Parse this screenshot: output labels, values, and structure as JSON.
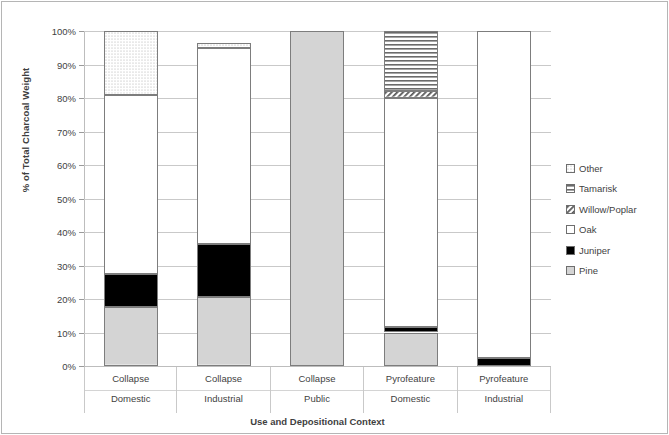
{
  "chart_data": {
    "type": "bar",
    "subtype": "stacked-100-percent",
    "title": "",
    "xlabel": "Use and Depositional Context",
    "ylabel": "% of Total Charcoal Weight",
    "ylim": [
      0,
      100
    ],
    "ytick_labels": [
      "0%",
      "10%",
      "20%",
      "30%",
      "40%",
      "50%",
      "60%",
      "70%",
      "80%",
      "90%",
      "100%"
    ],
    "ytick_values": [
      0,
      10,
      20,
      30,
      40,
      50,
      60,
      70,
      80,
      90,
      100
    ],
    "grid": true,
    "legend_position": "right",
    "categories": [
      {
        "line1": "Collapse",
        "line2": "Domestic"
      },
      {
        "line1": "Collapse",
        "line2": "Industrial"
      },
      {
        "line1": "Collapse",
        "line2": "Public"
      },
      {
        "line1": "Pyrofeature",
        "line2": "Domestic"
      },
      {
        "line1": "Pyrofeature",
        "line2": "Industrial"
      }
    ],
    "series": [
      {
        "name": "Pine",
        "pattern": "solid-gray",
        "fill": "#d4d4d4",
        "values": [
          17.5,
          20.5,
          100,
          10.0,
          0
        ]
      },
      {
        "name": "Juniper",
        "pattern": "solid-black",
        "fill": "#000000",
        "values": [
          10.0,
          16.0,
          0,
          1.5,
          2.5
        ]
      },
      {
        "name": "Oak",
        "pattern": "solid-white",
        "fill": "#ffffff",
        "values": [
          53.5,
          58.5,
          0,
          68.5,
          97.5
        ]
      },
      {
        "name": "Willow/Poplar",
        "pattern": "diagonal",
        "fill": "#ffffff",
        "values": [
          0,
          0,
          0,
          2.0,
          0
        ]
      },
      {
        "name": "Tamarisk",
        "pattern": "horizontal",
        "fill": "#ffffff",
        "values": [
          0,
          0,
          0,
          18.0,
          0
        ]
      },
      {
        "name": "Other",
        "pattern": "dotted",
        "fill": "#f2f2f2",
        "values": [
          19.0,
          1.5,
          0,
          0,
          0
        ]
      }
    ],
    "stack_order_bottom_to_top": [
      "Pine",
      "Juniper",
      "Oak",
      "Willow/Poplar",
      "Tamarisk",
      "Other"
    ],
    "legend_entries": [
      {
        "name": "Other",
        "pattern": "dotted"
      },
      {
        "name": "Tamarisk",
        "pattern": "horizontal"
      },
      {
        "name": "Willow/Poplar",
        "pattern": "diagonal"
      },
      {
        "name": "Oak",
        "pattern": "solid-white"
      },
      {
        "name": "Juniper",
        "pattern": "solid-black"
      },
      {
        "name": "Pine",
        "pattern": "solid-gray"
      }
    ]
  }
}
